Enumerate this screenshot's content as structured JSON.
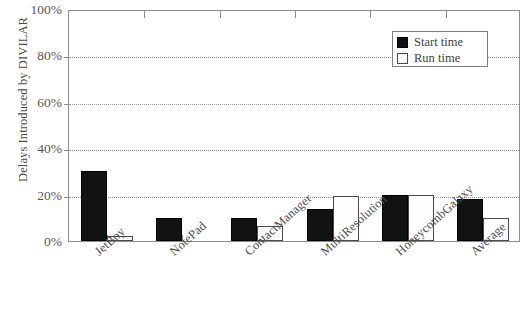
{
  "chart_data": {
    "type": "bar",
    "title": "",
    "xlabel": "",
    "ylabel": "Delays Introduced by DIVILAR",
    "ylim": [
      0,
      100
    ],
    "yunit": "%",
    "ytick_labels": [
      "0%",
      "20%",
      "40%",
      "60%",
      "80%",
      "100%"
    ],
    "ytick_values": [
      0,
      20,
      40,
      60,
      80,
      100
    ],
    "grid": "horizontal-dotted",
    "legend_position": "top-right",
    "categories": [
      "JetBoy",
      "NotePad",
      "ContactManager",
      "MultiResolution",
      "HoneycombGalaxy",
      "Average"
    ],
    "series": [
      {
        "name": "Start time",
        "color": "#111111",
        "values": [
          30,
          10,
          10,
          14,
          20,
          18
        ]
      },
      {
        "name": "Run time",
        "color": "#ffffff",
        "values": [
          2,
          0,
          6.5,
          19.5,
          20,
          10
        ]
      }
    ]
  },
  "legend": {
    "items": [
      {
        "label": "Start time"
      },
      {
        "label": "Run time"
      }
    ]
  },
  "axis": {
    "y_title": "Delays Introduced by DIVILAR"
  }
}
